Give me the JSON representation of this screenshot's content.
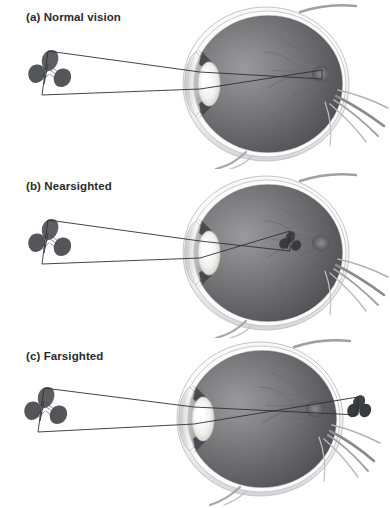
{
  "figure": {
    "background_color": "#ffffff",
    "label_color": "#2b2b2e",
    "ray_color": "#2f2f33",
    "object_color": "#55565a",
    "width": 390,
    "height": 508
  },
  "panels": [
    {
      "id": "normal-vision",
      "label": "(a) Normal vision",
      "object_name": "leaf",
      "object_position": "left",
      "image_location": "on the retina",
      "focus_description": "Light rays from the leaf converge exactly at the retina at the back of the eye."
    },
    {
      "id": "nearsighted",
      "label": "(b) Nearsighted",
      "object_name": "leaf",
      "object_position": "left",
      "image_location": "in front of the retina",
      "focus_description": "Light rays converge inside the vitreous chamber before reaching the retina."
    },
    {
      "id": "farsighted",
      "label": "(c) Farsighted",
      "object_name": "leaf",
      "object_position": "left",
      "image_location": "behind the retina",
      "focus_description": "Light rays would converge behind the eyeball, past the retina."
    }
  ],
  "eye_parts": [
    "cornea",
    "anterior-chamber",
    "iris",
    "lens",
    "vitreous-chamber",
    "retina",
    "choroid",
    "sclera",
    "optic-disc",
    "optic-nerve",
    "extraocular-muscle"
  ]
}
